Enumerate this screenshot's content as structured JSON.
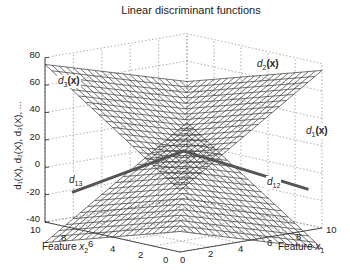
{
  "chart_data": {
    "type": "surface",
    "title": "Linear discriminant functions",
    "xlabel": "Feature x1",
    "ylabel": "Feature x2",
    "zlabel": "d1(X), d2(X), d3(X), ...",
    "x_ticks": [
      0,
      2,
      4,
      6,
      8,
      10
    ],
    "y_ticks": [
      0,
      2,
      4,
      6,
      8,
      10
    ],
    "z_ticks": [
      -40,
      -20,
      0,
      20,
      40,
      60,
      80
    ],
    "xlim": [
      0,
      10
    ],
    "ylim": [
      0,
      10
    ],
    "zlim": [
      -40,
      80
    ],
    "grid": true,
    "surfaces": [
      {
        "name": "d1(x)",
        "label_position": "right"
      },
      {
        "name": "d2(x)",
        "label_position": "upper-right"
      },
      {
        "name": "d3(x)",
        "label_position": "upper-left"
      }
    ],
    "annotations": [
      {
        "text": "d13",
        "type": "decision-boundary",
        "side": "left"
      },
      {
        "text": "d12",
        "type": "decision-boundary",
        "side": "right"
      }
    ]
  },
  "labels": {
    "title": "Linear discriminant functions",
    "z_axis": "d₁(X), d₂(X), d₃(X), ...",
    "x1_axis_prefix": "Feature ",
    "x1_axis_var": "x",
    "x1_axis_sub": "1",
    "x2_axis_prefix": "Feature ",
    "x2_axis_var": "x",
    "x2_axis_sub": "2",
    "d1": "d",
    "d1_sub": "1",
    "d2": "d",
    "d2_sub": "2",
    "d3": "d",
    "d3_sub": "3",
    "bold_x": "(x)",
    "d13": "d",
    "d13_sub": "13",
    "d12": "d",
    "d12_sub": "12"
  },
  "ticks": {
    "z": [
      "80",
      "60",
      "40",
      "20",
      "0",
      "-20",
      "-40"
    ],
    "x2": [
      "10",
      "8",
      "6",
      "4",
      "2",
      "0"
    ],
    "x1": [
      "0",
      "2",
      "4",
      "6",
      "8",
      "10"
    ]
  }
}
